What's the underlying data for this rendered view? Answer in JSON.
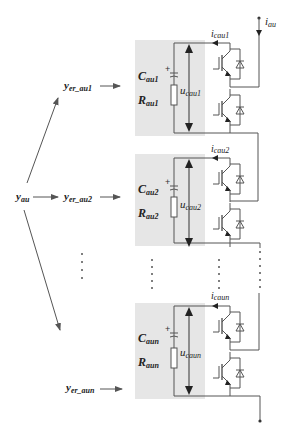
{
  "diagram": {
    "input_signal": {
      "main": "y",
      "sub": "au"
    },
    "output_current": {
      "main": "i",
      "sub": "au"
    },
    "modules": [
      {
        "id": "1",
        "error_signal": {
          "main": "y",
          "sub": "er_au1"
        },
        "capacitor": {
          "main": "C",
          "sub": "au1"
        },
        "resistor": {
          "main": "R",
          "sub": "au1"
        },
        "voltage": {
          "main": "u",
          "sub": "cau1"
        },
        "current": {
          "main": "i",
          "sub": "cau1"
        }
      },
      {
        "id": "2",
        "error_signal": {
          "main": "y",
          "sub": "er_au2"
        },
        "capacitor": {
          "main": "C",
          "sub": "au2"
        },
        "resistor": {
          "main": "R",
          "sub": "au2"
        },
        "voltage": {
          "main": "u",
          "sub": "cau2"
        },
        "current": {
          "main": "i",
          "sub": "cau2"
        }
      },
      {
        "id": "n",
        "error_signal": {
          "main": "y",
          "sub": "er_aun"
        },
        "capacitor": {
          "main": "C",
          "sub": "aun"
        },
        "resistor": {
          "main": "R",
          "sub": "aun"
        },
        "voltage": {
          "main": "u",
          "sub": "caun"
        },
        "current": {
          "main": "i",
          "sub": "caun"
        }
      }
    ],
    "plus_sign": "+",
    "colors": {
      "module_background": "#e6e6e6",
      "line": "#555555",
      "arrow": "#333333"
    }
  }
}
